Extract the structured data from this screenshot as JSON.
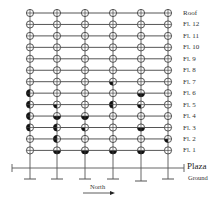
{
  "figure": {
    "type": "building-frame-elevation",
    "columns": 6,
    "floors": [
      "Roof",
      "Fl. 12",
      "Fl. 11",
      "Fl. 10",
      "Fl. 9",
      "Fl. 8",
      "Fl. 7",
      "Fl. 6",
      "Fl. 5",
      "Fl. 4",
      "Fl. 3",
      "Fl. 2",
      "Fl. 1"
    ],
    "plaza_label": "Plaza",
    "ground_label": "Ground",
    "north_label": "North",
    "colors": {
      "line": "#555555",
      "node_fill_dark": "#111111",
      "label": "#333333"
    },
    "damaged_joints": [
      {
        "floor": "Fl. 7",
        "column": 4,
        "pattern": "lower-left"
      },
      {
        "floor": "Fl. 6",
        "column": 1,
        "pattern": "left"
      },
      {
        "floor": "Fl. 6",
        "column": 5,
        "pattern": "lower"
      },
      {
        "floor": "Fl. 5",
        "column": 1,
        "pattern": "left"
      },
      {
        "floor": "Fl. 5",
        "column": 2,
        "pattern": "lower-left"
      },
      {
        "floor": "Fl. 5",
        "column": 4,
        "pattern": "left"
      },
      {
        "floor": "Fl. 5",
        "column": 5,
        "pattern": "lower-left"
      },
      {
        "floor": "Fl. 4",
        "column": 1,
        "pattern": "left"
      },
      {
        "floor": "Fl. 4",
        "column": 2,
        "pattern": "lower"
      },
      {
        "floor": "Fl. 4",
        "column": 3,
        "pattern": "lower"
      },
      {
        "floor": "Fl. 3",
        "column": 1,
        "pattern": "left"
      },
      {
        "floor": "Fl. 3",
        "column": 2,
        "pattern": "left"
      },
      {
        "floor": "Fl. 3",
        "column": 3,
        "pattern": "lower-left"
      },
      {
        "floor": "Fl. 3",
        "column": 5,
        "pattern": "lower"
      },
      {
        "floor": "Fl. 2",
        "column": 2,
        "pattern": "left"
      },
      {
        "floor": "Fl. 2",
        "column": 6,
        "pattern": "lower-left"
      },
      {
        "floor": "Fl. 1",
        "column": 2,
        "pattern": "lower"
      },
      {
        "floor": "Fl. 1",
        "column": 3,
        "pattern": "lower"
      },
      {
        "floor": "Fl. 1",
        "column": 4,
        "pattern": "lower"
      },
      {
        "floor": "Fl. 1",
        "column": 5,
        "pattern": "lower"
      }
    ]
  }
}
